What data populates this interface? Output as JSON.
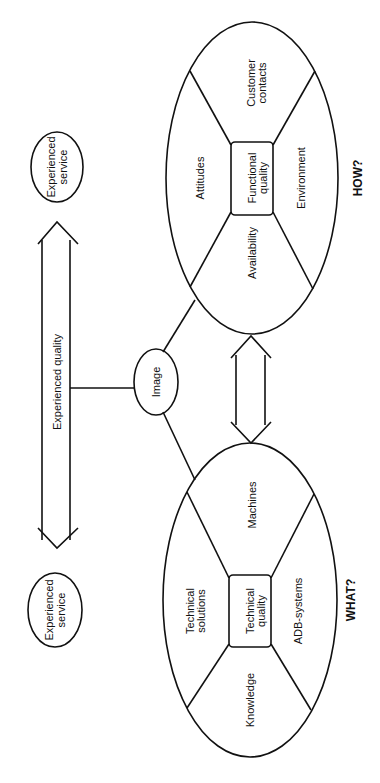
{
  "diagram": {
    "orientation": "rotated -90deg",
    "expected_node": {
      "line1": "Experienced",
      "line2": "service"
    },
    "experienced_node": {
      "line1": "Experienced",
      "line2": "service"
    },
    "quality_arrow": {
      "label": "Experienced quality"
    },
    "image_node": {
      "label": "Image"
    },
    "functional": {
      "center": {
        "line1": "Functional",
        "line2": "quality"
      },
      "segments": {
        "top": {
          "line1": "Customer",
          "line2": "contacts"
        },
        "left": {
          "label": "Attitudes"
        },
        "right": {
          "label": "Environment"
        },
        "bottom": {
          "label": "Availability"
        }
      },
      "question": "HOW?"
    },
    "technical": {
      "center": {
        "line1": "Technical",
        "line2": "quality"
      },
      "segments": {
        "top": {
          "label": "Machines"
        },
        "left": {
          "line1": "Technical",
          "line2": "solutions"
        },
        "right": {
          "label": "ADB-systems"
        },
        "bottom": {
          "label": "Knowledge"
        }
      },
      "question": "WHAT?"
    }
  }
}
